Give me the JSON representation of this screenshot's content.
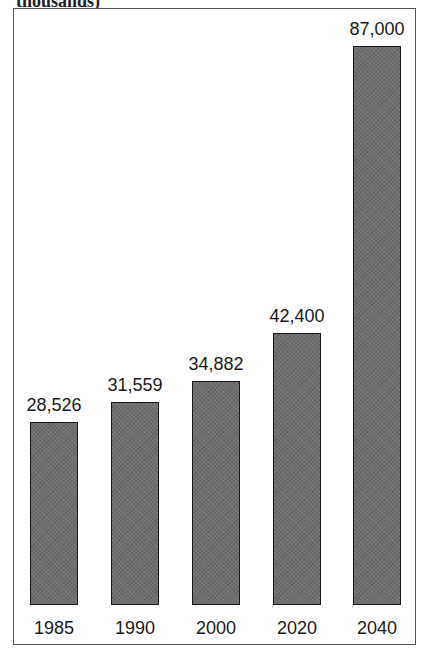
{
  "chart_data": {
    "type": "bar",
    "categories": [
      "1985",
      "1990",
      "2000",
      "2020",
      "2040"
    ],
    "values": [
      28526,
      31559,
      34882,
      42400,
      87000
    ],
    "value_labels": [
      "28,526",
      "31,559",
      "34,882",
      "42,400",
      "87,000"
    ],
    "xlabel": "",
    "ylabel": "",
    "ylim": [
      0,
      90000
    ],
    "grid": false,
    "legend": null,
    "bar_color": "#6e6e6e"
  },
  "caption": "thousands)"
}
